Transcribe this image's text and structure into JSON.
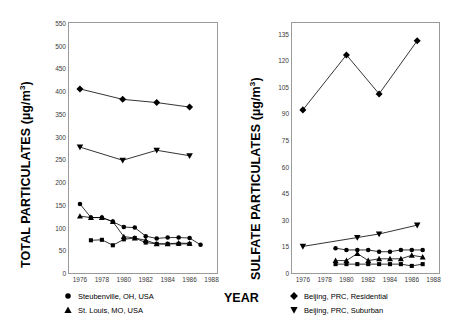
{
  "figure": {
    "xlabel": "YEAR"
  },
  "chart_data": [
    {
      "id": "total-particulates",
      "type": "line",
      "title": "",
      "ylabel": "TOTAL PARTICULATES (µg/m³)",
      "xlabel": "YEAR",
      "ylim": [
        0,
        550
      ],
      "xlim": [
        1975,
        1988.5
      ],
      "yticks": [
        0,
        50,
        100,
        150,
        200,
        250,
        300,
        350,
        400,
        450,
        500,
        550
      ],
      "xticks": [
        1976,
        1978,
        1980,
        1982,
        1984,
        1986,
        1988
      ],
      "grid": false,
      "legend_position": "below-left",
      "series": [
        {
          "name": "Beijing, PRC, Residential",
          "marker": "diamond",
          "x": [
            1976.0,
            1979.9,
            1983.0,
            1986.0
          ],
          "values": [
            405,
            382,
            375,
            365
          ]
        },
        {
          "name": "Beijing, PRC, Suburban",
          "marker": "triangle-down",
          "x": [
            1976.0,
            1979.9,
            1983.0,
            1986.0
          ],
          "values": [
            277,
            248,
            270,
            258
          ]
        },
        {
          "name": "Steubenville, OH, USA",
          "marker": "circle",
          "x": [
            1976.0,
            1977.0,
            1978.0,
            1979.0,
            1980.0,
            1981.0,
            1982.0,
            1983.0,
            1984.0,
            1985.0,
            1986.0,
            1987.0
          ],
          "values": [
            152,
            122,
            122,
            113,
            101,
            100,
            81,
            76,
            78,
            78,
            77,
            62
          ]
        },
        {
          "name": "St. Louis, MO, USA",
          "marker": "triangle-up",
          "x": [
            1976.0,
            1977.0,
            1978.0,
            1979.0,
            1980.0,
            1981.0,
            1982.0,
            1983.0,
            1984.0,
            1985.0,
            1986.0
          ],
          "values": [
            125,
            122,
            122,
            113,
            80,
            77,
            72,
            64,
            64,
            66,
            65
          ]
        },
        {
          "name": "",
          "marker": "square",
          "x": [
            1977.0,
            1978.0,
            1979.0,
            1980.0,
            1981.0,
            1982.0,
            1983.0,
            1984.0,
            1985.0,
            1986.0
          ],
          "values": [
            72,
            73,
            61,
            74,
            77,
            67,
            64,
            64,
            64,
            64
          ]
        }
      ]
    },
    {
      "id": "sulfate-particulates",
      "type": "line",
      "title": "",
      "ylabel": "SULFATE PARTICULATES (µg/m³)",
      "xlabel": "YEAR",
      "ylim": [
        0,
        141
      ],
      "xlim": [
        1975,
        1988.5
      ],
      "yticks": [
        0,
        15,
        30,
        45,
        60,
        75,
        90,
        105,
        120,
        135
      ],
      "xticks": [
        1976,
        1978,
        1980,
        1982,
        1984,
        1986,
        1988
      ],
      "grid": false,
      "legend_position": "below-right",
      "series": [
        {
          "name": "Beijing, PRC, Residential",
          "marker": "diamond",
          "x": [
            1976.0,
            1980.0,
            1983.0,
            1986.5
          ],
          "values": [
            92,
            123,
            101,
            131
          ]
        },
        {
          "name": "Beijing, PRC, Suburban",
          "marker": "triangle-down",
          "x": [
            1976.0,
            1981.0,
            1983.0,
            1986.5
          ],
          "values": [
            15,
            20,
            22,
            27
          ]
        },
        {
          "name": "Steubenville, OH, USA",
          "marker": "circle",
          "x": [
            1979.0,
            1980.0,
            1981.0,
            1982.0,
            1983.0,
            1984.0,
            1985.0,
            1986.0,
            1987.0
          ],
          "values": [
            14,
            13,
            13,
            13,
            12,
            12,
            13,
            13,
            13
          ]
        },
        {
          "name": "St. Louis, MO, USA",
          "marker": "triangle-up",
          "x": [
            1979.0,
            1980.0,
            1981.0,
            1982.0,
            1983.0,
            1984.0,
            1985.0,
            1986.0,
            1987.0
          ],
          "values": [
            7,
            7,
            11,
            7,
            8,
            8,
            8,
            10,
            9
          ]
        },
        {
          "name": "",
          "marker": "square",
          "x": [
            1979.0,
            1980.0,
            1981.0,
            1982.0,
            1983.0,
            1984.0,
            1985.0,
            1986.0,
            1987.0
          ],
          "values": [
            5,
            5,
            5,
            5,
            5,
            5,
            5,
            4,
            5
          ]
        }
      ]
    }
  ],
  "legends": {
    "left": [
      {
        "marker": "circle",
        "label": "Steubenville, OH, USA"
      },
      {
        "marker": "triangle-up",
        "label": "St. Louis, MO, USA"
      }
    ],
    "right": [
      {
        "marker": "diamond",
        "label": "Beijing, PRC, Residential"
      },
      {
        "marker": "triangle-down",
        "label": "Beijing, PRC, Suburban"
      }
    ]
  }
}
